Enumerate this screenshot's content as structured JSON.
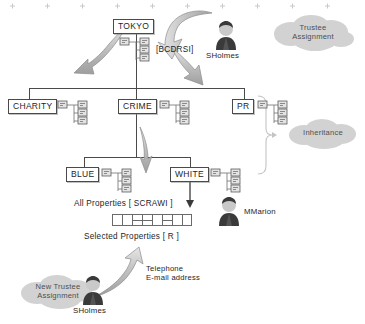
{
  "diagram": {
    "nodes": {
      "tokyo": "TOKYO",
      "charity": "CHARITY",
      "crime": "CRIME",
      "pr": "PR",
      "blue": "BLUE",
      "white": "WHITE"
    },
    "labels": {
      "privileges": "[BCDRSI]",
      "all_properties": "All Properties [ SCRAWI ]",
      "selected_properties": "Selected Properties [ R ]",
      "contact_line1": "Telephone",
      "contact_line2": "E-mail address"
    },
    "clouds": {
      "trustee_assignment": "Trustee\nAssignment",
      "trustee_assignment_line1": "Trustee",
      "trustee_assignment_line2": "Assignment",
      "inheritance": "Inheritance",
      "new_trustee_line1": "New Trustee",
      "new_trustee_line2": "Assignment"
    },
    "people": {
      "sholmes_top": "SHolmes",
      "mmarion": "MMarion",
      "sholmes_bottom": "SHolmes"
    },
    "icons": {
      "node_cluster": "tree-cluster-icon",
      "person": "person-icon",
      "arrow": "curved-arrow-icon",
      "bracket": "inheritance-bracket-icon"
    },
    "colors": {
      "line": "#4a4a4a",
      "box_border": "#4a4a4a",
      "arrow_fill": "#b9b9b9",
      "arrow_stroke": "#8d8d8d",
      "cloud_fill": "#cfcfcf",
      "person_body": "#3a3a3a",
      "person_head": "#c9c9c9",
      "text": "#1e1e1e"
    },
    "grid": {
      "cells": 8,
      "split_indices": [
        2,
        3,
        5
      ]
    }
  }
}
